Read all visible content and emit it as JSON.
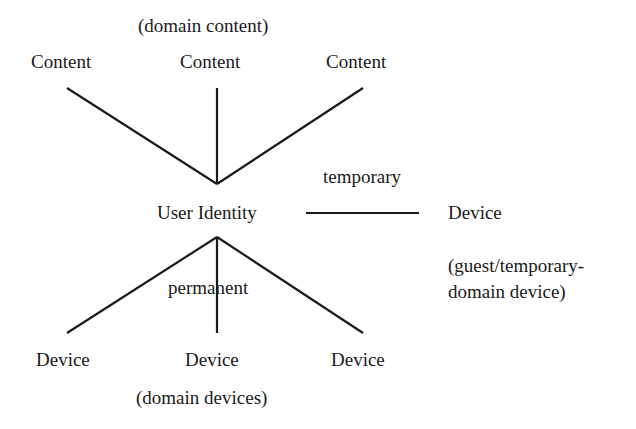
{
  "diagram": {
    "top_caption": "(domain content)",
    "content_nodes": [
      "Content",
      "Content",
      "Content"
    ],
    "center_node": "User Identity",
    "temporary_label": "temporary",
    "right_device": "Device",
    "right_caption_line1": "(guest/temporary-",
    "right_caption_line2": "domain device)",
    "permanent_label": "permanent",
    "device_nodes": [
      "Device",
      "Device",
      "Device"
    ],
    "bottom_caption": "(domain devices)"
  },
  "colors": {
    "line": "#1a1a1a",
    "text": "#1a1a1a",
    "background": "#ffffff"
  }
}
